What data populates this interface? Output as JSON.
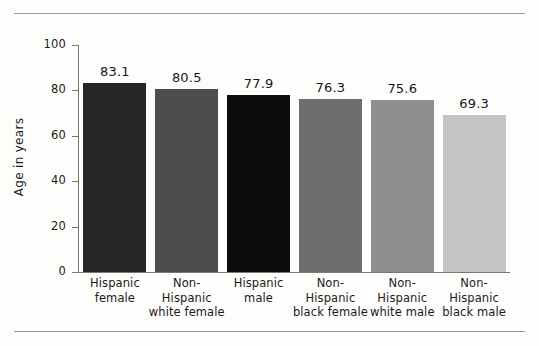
{
  "figure": {
    "background_color": "#fdfdfc",
    "rule_color": "#9a9a9a",
    "axis_color": "#777777"
  },
  "chart_data": {
    "type": "bar",
    "title": "",
    "subtitle": "",
    "xlabel": "",
    "ylabel": "Age in years",
    "ylim": [
      0,
      100
    ],
    "yticks": [
      0,
      20,
      40,
      60,
      80,
      100
    ],
    "ytick_labels": [
      "0",
      "20",
      "40",
      "60",
      "80",
      "100"
    ],
    "grid": false,
    "legend": false,
    "legend_position": "none",
    "categories": [
      "Hispanic female",
      "Non-Hispanic white female",
      "Hispanic male",
      "Non-Hispanic black female",
      "Non-Hispanic white male",
      "Non-Hispanic black male"
    ],
    "category_label_lines": [
      [
        "Hispanic",
        "female"
      ],
      [
        "Non-",
        "Hispanic",
        "white female"
      ],
      [
        "Hispanic",
        "male"
      ],
      [
        "Non-",
        "Hispanic",
        "black female"
      ],
      [
        "Non-",
        "Hispanic",
        "white male"
      ],
      [
        "Non-",
        "Hispanic",
        "black male"
      ]
    ],
    "values": [
      83.1,
      80.5,
      77.9,
      76.3,
      75.6,
      69.3
    ],
    "value_labels": [
      "83.1",
      "80.5",
      "77.9",
      "76.3",
      "75.6",
      "69.3"
    ],
    "bar_colors": [
      "#262626",
      "#4d4d4d",
      "#0d0d0d",
      "#6e6e6e",
      "#8f8f8f",
      "#c4c4c4"
    ]
  }
}
